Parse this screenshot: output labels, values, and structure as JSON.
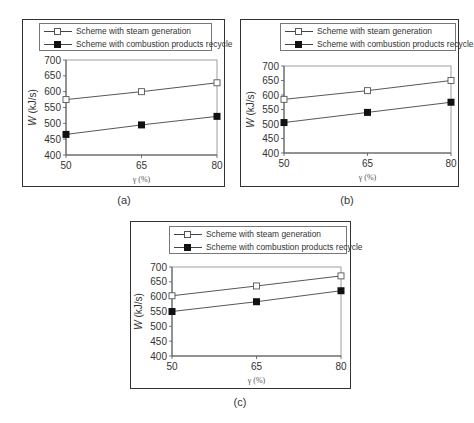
{
  "legend": {
    "series1": "Scheme with steam generation",
    "series2": "Scheme with combustion products recycle"
  },
  "axes": {
    "ylabel_var": "W",
    "ylabel_unit": " (kJ/s)",
    "xlabel": "γ (%)",
    "y_ticks": [
      "700",
      "650",
      "600",
      "550",
      "500",
      "450",
      "400"
    ],
    "x_ticks": [
      "50",
      "65",
      "80"
    ]
  },
  "captions": [
    "(a)",
    "(b)",
    "(c)"
  ],
  "chart_data": [
    {
      "type": "line",
      "panel": "(a)",
      "x": [
        50,
        65,
        80
      ],
      "xlabel": "γ (%)",
      "ylabel": "W (kJ/s)",
      "ylim": [
        400,
        700
      ],
      "yticks": [
        400,
        450,
        500,
        550,
        600,
        650,
        700
      ],
      "grid": false,
      "legend_position": "top",
      "series": [
        {
          "name": "Scheme with steam generation",
          "marker": "open-square",
          "values": [
            575,
            600,
            628
          ]
        },
        {
          "name": "Scheme with combustion products recycle",
          "marker": "filled-square",
          "values": [
            465,
            495,
            522
          ]
        }
      ]
    },
    {
      "type": "line",
      "panel": "(b)",
      "x": [
        50,
        65,
        80
      ],
      "xlabel": "γ (%)",
      "ylabel": "W (kJ/s)",
      "ylim": [
        400,
        700
      ],
      "yticks": [
        400,
        450,
        500,
        550,
        600,
        650,
        700
      ],
      "grid": false,
      "legend_position": "top",
      "series": [
        {
          "name": "Scheme with steam generation",
          "marker": "open-square",
          "values": [
            585,
            615,
            650
          ]
        },
        {
          "name": "Scheme with combustion products recycle",
          "marker": "filled-square",
          "values": [
            505,
            540,
            575
          ]
        }
      ]
    },
    {
      "type": "line",
      "panel": "(c)",
      "x": [
        50,
        65,
        80
      ],
      "xlabel": "γ (%)",
      "ylabel": "W (kJ/s)",
      "ylim": [
        400,
        700
      ],
      "yticks": [
        400,
        450,
        500,
        550,
        600,
        650,
        700
      ],
      "grid": false,
      "legend_position": "top",
      "series": [
        {
          "name": "Scheme with steam generation",
          "marker": "open-square",
          "values": [
            603,
            636,
            670
          ]
        },
        {
          "name": "Scheme with combustion products recycle",
          "marker": "filled-square",
          "values": [
            550,
            583,
            620
          ]
        }
      ]
    }
  ]
}
